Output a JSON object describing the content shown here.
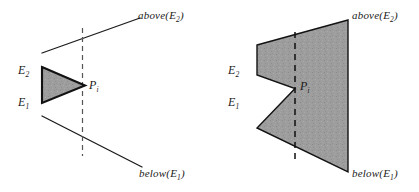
{
  "figure": {
    "caption": "",
    "background_color": "#ffffff",
    "ink_color": "#1a1a1a",
    "fill_color": "#9a9a9a",
    "diagrams": [
      {
        "name": "left-diagram",
        "labels": {
          "above": "above",
          "above_arg": "E",
          "above_sub": "2",
          "below": "below",
          "below_arg": "E",
          "below_sub": "1",
          "edge_top": "E",
          "edge_top_sub": "2",
          "edge_bottom": "E",
          "edge_bottom_sub": "1",
          "point": "P",
          "point_sub": "i",
          "open_paren": "(",
          "close_paren": ")"
        }
      },
      {
        "name": "right-diagram",
        "labels": {
          "above": "above",
          "above_arg": "E",
          "above_sub": "2",
          "below": "below",
          "below_arg": "E",
          "below_sub": "1",
          "edge_top": "E",
          "edge_top_sub": "2",
          "edge_bottom": "E",
          "edge_bottom_sub": "1",
          "point": "P",
          "point_sub": "i",
          "open_paren": "(",
          "close_paren": ")"
        }
      }
    ]
  }
}
